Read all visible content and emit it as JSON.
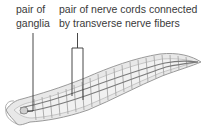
{
  "labels": {
    "ganglia": {
      "line1": "pair of",
      "line2": "ganglia"
    },
    "nerve_cords": {
      "line1": "pair of nerve cords connected",
      "line2": "by transverse nerve fibers"
    }
  },
  "colors": {
    "text": "#3a3a3a",
    "leader": "#333333",
    "body_fill": "#e6e6e6",
    "body_outline": "#9a9a9a",
    "segment": "#a8a8a8",
    "nerve_cord": "#7a7a7a"
  },
  "illustration": {
    "subject": "flatworm nervous system (ladder-like)"
  }
}
